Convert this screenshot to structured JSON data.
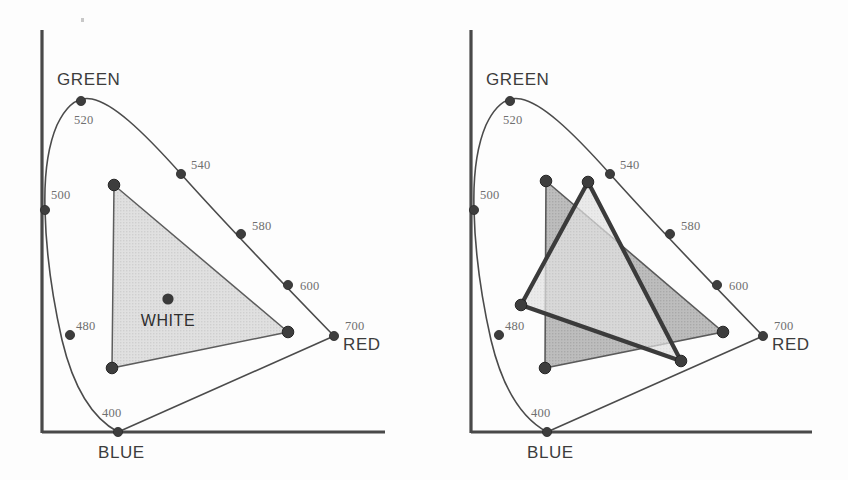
{
  "figure": {
    "title": "",
    "background_color": "#fdfdfd",
    "panel_count": 2
  },
  "chart_data": [
    {
      "type": "scatter",
      "id": "cie-chromaticity-single-gamut",
      "title": "",
      "subtitle": "",
      "xlabel": "",
      "ylabel": "",
      "grid": false,
      "legend": null,
      "axis_lines": [
        "left",
        "bottom"
      ],
      "corner_labels": [
        {
          "text": "GREEN",
          "x": 57,
          "y": 85
        },
        {
          "text": "RED",
          "x": 343,
          "y": 350
        },
        {
          "text": "BLUE",
          "x": 98,
          "y": 458
        }
      ],
      "wavelength_ticks": [
        {
          "label": "400",
          "point_x": 118,
          "point_y": 432,
          "label_x": 102,
          "label_y": 417
        },
        {
          "label": "480",
          "point_x": 70,
          "point_y": 335,
          "label_x": 76,
          "label_y": 330
        },
        {
          "label": "500",
          "point_x": 45,
          "point_y": 210,
          "label_x": 51,
          "label_y": 199
        },
        {
          "label": "520",
          "point_x": 81,
          "point_y": 101,
          "label_x": 74,
          "label_y": 124
        },
        {
          "label": "540",
          "point_x": 181,
          "point_y": 174,
          "label_x": 191,
          "label_y": 169
        },
        {
          "label": "580",
          "point_x": 241,
          "point_y": 234,
          "label_x": 252,
          "label_y": 230
        },
        {
          "label": "600",
          "point_x": 288,
          "point_y": 285,
          "label_x": 300,
          "label_y": 290
        },
        {
          "label": "700",
          "point_x": 334,
          "point_y": 336,
          "label_x": 345,
          "label_y": 330
        }
      ],
      "gamut_triangles": [
        {
          "name": "display-gamut",
          "fill": "#dedede",
          "stroke": "#575757",
          "vertices": [
            {
              "x": 114,
              "y": 185
            },
            {
              "x": 288,
              "y": 332
            },
            {
              "x": 112,
              "y": 368
            }
          ]
        }
      ],
      "white_point": {
        "label": "WHITE",
        "x": 168,
        "y": 299,
        "label_x": 168,
        "label_y": 326
      }
    },
    {
      "type": "scatter",
      "id": "cie-chromaticity-two-gamuts",
      "title": "",
      "subtitle": "",
      "xlabel": "",
      "ylabel": "",
      "grid": false,
      "legend": null,
      "axis_lines": [
        "left",
        "bottom"
      ],
      "corner_labels": [
        {
          "text": "GREEN",
          "x": 57,
          "y": 85
        },
        {
          "text": "RED",
          "x": 343,
          "y": 350
        },
        {
          "text": "BLUE",
          "x": 98,
          "y": 458
        }
      ],
      "wavelength_ticks": [
        {
          "label": "400",
          "point_x": 118,
          "point_y": 432,
          "label_x": 102,
          "label_y": 417
        },
        {
          "label": "480",
          "point_x": 70,
          "point_y": 335,
          "label_x": 76,
          "label_y": 330
        },
        {
          "label": "500",
          "point_x": 45,
          "point_y": 210,
          "label_x": 51,
          "label_y": 199
        },
        {
          "label": "520",
          "point_x": 81,
          "point_y": 101,
          "label_x": 74,
          "label_y": 124
        },
        {
          "label": "540",
          "point_x": 181,
          "point_y": 174,
          "label_x": 191,
          "label_y": 169
        },
        {
          "label": "580",
          "point_x": 241,
          "point_y": 234,
          "label_x": 252,
          "label_y": 230
        },
        {
          "label": "600",
          "point_x": 288,
          "point_y": 285,
          "label_x": 300,
          "label_y": 290
        },
        {
          "label": "700",
          "point_x": 334,
          "point_y": 336,
          "label_x": 345,
          "label_y": 330
        }
      ],
      "gamut_triangles": [
        {
          "name": "gamut-a-dark",
          "fill": "#b9b9b9",
          "stroke": "#5a5a5a",
          "vertices": [
            {
              "x": 117,
              "y": 181
            },
            {
              "x": 294,
              "y": 332
            },
            {
              "x": 116,
              "y": 368
            }
          ]
        },
        {
          "name": "gamut-b-light",
          "fill": "#dcdcdc",
          "stroke": "#3b3b3b",
          "vertices": [
            {
              "x": 159,
              "y": 182
            },
            {
              "x": 252,
              "y": 361
            },
            {
              "x": 92,
              "y": 305
            }
          ]
        }
      ],
      "white_point": null
    }
  ],
  "locus_path": "M 118 432 C 92 418 73 386 62 340 C 52 296 46 252 45 210 C 44 176 48 146 57 125 C 66 106 78 96 92 99 C 112 103 140 128 181 174 C 215 212 262 262 334 336",
  "purple_line_path": "M 118 432 L 334 336",
  "accent_colors": {
    "ink": "#3c3c3c",
    "axis": "#494949",
    "locus": "#4b4b4b",
    "tick_text": "#6f6f6f",
    "gamut_light_fill": "#dedede",
    "gamut_dark_fill": "#b9b9b9",
    "bold_outline": "#3b3b3b",
    "paper": "#fdfdfd"
  }
}
